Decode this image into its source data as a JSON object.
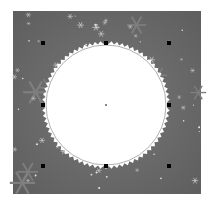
{
  "canvas": {
    "background": "#ffffff",
    "artboard": {
      "x": 13,
      "y": 11,
      "width": 188,
      "height": 183,
      "fill": "#6e6e6e",
      "pattern": "snowflakes"
    },
    "shape": {
      "type": "serrated-circle",
      "cx": 106,
      "cy": 105,
      "inner_radius": 60,
      "outer_radius": 64,
      "teeth": 72,
      "fill": "#ffffff",
      "outline": "#9a9a9a"
    },
    "selection": {
      "handles": [
        {
          "name": "handle-top-left",
          "x": 43,
          "y": 43
        },
        {
          "name": "handle-top-center",
          "x": 106,
          "y": 43
        },
        {
          "name": "handle-top-right",
          "x": 169,
          "y": 43
        },
        {
          "name": "handle-middle-left",
          "x": 43,
          "y": 105
        },
        {
          "name": "handle-middle-right",
          "x": 169,
          "y": 105
        },
        {
          "name": "handle-bottom-left",
          "x": 43,
          "y": 166
        },
        {
          "name": "handle-bottom-center",
          "x": 106,
          "y": 166
        },
        {
          "name": "handle-bottom-right",
          "x": 169,
          "y": 166
        }
      ],
      "handle_color": "#000000",
      "center_point": {
        "x": 106,
        "y": 105,
        "color": "#888888"
      }
    }
  }
}
